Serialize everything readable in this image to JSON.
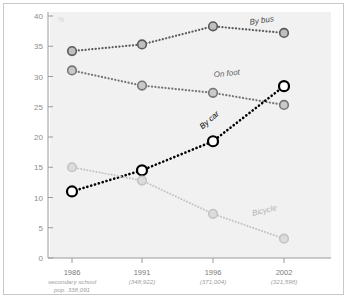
{
  "chart_data": {
    "type": "line",
    "title": "",
    "xlabel": "",
    "ylabel": "%",
    "ylim": [
      0,
      40
    ],
    "ytick_step": 5,
    "grid": false,
    "legend_position": "inline-end-of-line",
    "categories": [
      "1986",
      "1991",
      "1996",
      "2002"
    ],
    "category_sublabels": [
      "secondary school",
      "(348,922)",
      "(371,004)",
      "(321,598)"
    ],
    "category_sublabels_line2": [
      "pop. 338,091",
      "",
      "",
      ""
    ],
    "yticks": [
      "0",
      "5",
      "10",
      "15",
      "20",
      "25",
      "30",
      "35",
      "40"
    ],
    "series": [
      {
        "name": "By bus",
        "color": "#5a5a5a",
        "marker_fill": "#bfbfbf",
        "line_width": 2.2,
        "values": [
          34.2,
          35.3,
          38.3,
          37.2
        ],
        "label": "By bus"
      },
      {
        "name": "On foot",
        "color": "#757575",
        "marker_fill": "#c9c9c9",
        "line_width": 2.2,
        "values": [
          31.0,
          28.5,
          27.3,
          25.3
        ],
        "label": "On foot"
      },
      {
        "name": "By car",
        "color": "#000000",
        "marker_fill": "#ffffff",
        "line_width": 2.6,
        "values": [
          11.0,
          14.5,
          19.3,
          28.4
        ],
        "label": "By car"
      },
      {
        "name": "Bicycle",
        "color": "#c4c4c4",
        "marker_fill": "#dcdcdc",
        "line_width": 2.0,
        "values": [
          15.0,
          12.8,
          7.3,
          3.2
        ],
        "label": "Bicycle"
      }
    ],
    "unit_symbol": "%"
  },
  "labels": {
    "by_bus": "By bus",
    "on_foot": "On foot",
    "by_car": "By car",
    "bicycle": "Bicycle",
    "percent": "%"
  }
}
